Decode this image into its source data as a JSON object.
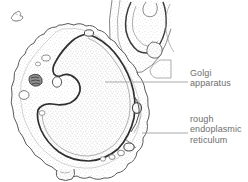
{
  "figure": {
    "kind": "biology-cell-diagram",
    "caption_text": "",
    "background_color": "#ffffff",
    "ink_color": "#555555",
    "stipple_color": "#b9b9b9",
    "label_color": "#6e6e6e",
    "leader_color": "#9a9a9a"
  },
  "labels": {
    "golgi": {
      "name": "Golgi apparatus",
      "lines": [
        "Golgi",
        "apparatus"
      ],
      "leader": {
        "x1": 105,
        "y1": 82,
        "x2": 188,
        "y2": 82
      }
    },
    "rough_er": {
      "name": "rough endoplasmic reticulum",
      "lines": [
        "rough",
        "endoplasmic",
        "reticulum"
      ],
      "leader": {
        "x1": 142,
        "y1": 133,
        "x2": 188,
        "y2": 133
      }
    }
  },
  "structures": [
    {
      "id": "plasma-membrane",
      "label": "cell plasma membrane outline"
    },
    {
      "id": "nucleus-boundary",
      "label": "nuclear envelope"
    },
    {
      "id": "golgi-stack",
      "label": "Golgi apparatus stack"
    },
    {
      "id": "rough-er-membrane",
      "label": "rough endoplasmic reticulum"
    },
    {
      "id": "vesicles",
      "label": "membrane vesicles"
    },
    {
      "id": "neighbor-cell",
      "label": "adjacent cell fragment"
    },
    {
      "id": "cell-fragment-top-left",
      "label": "small cell fragment"
    },
    {
      "id": "basal-protrusion",
      "label": "basal cell protrusion"
    }
  ]
}
